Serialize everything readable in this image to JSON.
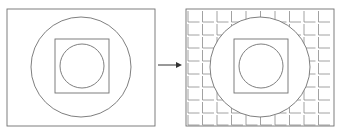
{
  "diagram": {
    "stroke_color": "#707070",
    "grid_color": "#8a8a8a",
    "background": "#ffffff",
    "left_panel": {
      "frame": {
        "x": 7,
        "y": 9,
        "w": 148,
        "h": 117
      },
      "outer_circle": {
        "cx": 81,
        "cy": 67,
        "r": 50
      },
      "square": {
        "x": 55,
        "y": 39,
        "w": 54,
        "h": 54
      },
      "inner_circle": {
        "cx": 82,
        "cy": 66,
        "r": 22
      }
    },
    "arrow": {
      "x1": 158,
      "y1": 65,
      "x2": 182,
      "y2": 65,
      "label": ""
    },
    "right_panel": {
      "frame": {
        "x": 186,
        "y": 9,
        "w": 148,
        "h": 117
      },
      "grid": {
        "cell_w": 14.5,
        "cell_h": 13,
        "cols": 10,
        "rows": 9
      },
      "outer_circle": {
        "cx": 260,
        "cy": 67,
        "r": 50
      },
      "square": {
        "x": 234,
        "y": 39,
        "w": 54,
        "h": 54
      },
      "inner_circle": {
        "cx": 261,
        "cy": 66,
        "r": 22
      }
    }
  }
}
